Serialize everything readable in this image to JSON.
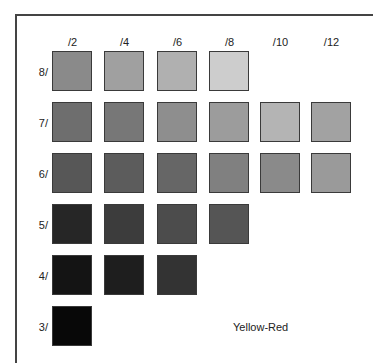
{
  "chart_data": {
    "type": "heatmap",
    "title": "Yellow-Red",
    "xlabel": "Chroma",
    "ylabel": "Value",
    "columns": [
      "/2",
      "/4",
      "/6",
      "/8",
      "/10",
      "/12"
    ],
    "rows": [
      "8/",
      "7/",
      "6/",
      "5/",
      "4/",
      "3/"
    ],
    "cells": [
      [
        "#8a8a8a",
        "#a0a0a0",
        "#b0b0b0",
        "#cdcdcd",
        null,
        null
      ],
      [
        "#6e6e6e",
        "#777777",
        "#8e8e8e",
        "#9c9c9c",
        "#b4b4b4",
        "#a2a2a2"
      ],
      [
        "#575757",
        "#5c5c5c",
        "#666666",
        "#808080",
        "#8a8a8a",
        "#9a9a9a"
      ],
      [
        "#262626",
        "#3c3c3c",
        "#4c4c4c",
        "#555555",
        null,
        null
      ],
      [
        "#141414",
        "#1e1e1e",
        "#333333",
        null,
        null,
        null
      ],
      [
        "#080808",
        null,
        null,
        null,
        null,
        null
      ]
    ],
    "grid": false,
    "legend": "none"
  },
  "labels": {
    "columns": [
      "/2",
      "/4",
      "/6",
      "/8",
      "/10",
      "/12"
    ],
    "rows": [
      "8/",
      "7/",
      "6/",
      "5/",
      "4/",
      "3/"
    ],
    "hue": "Yellow-Red"
  }
}
